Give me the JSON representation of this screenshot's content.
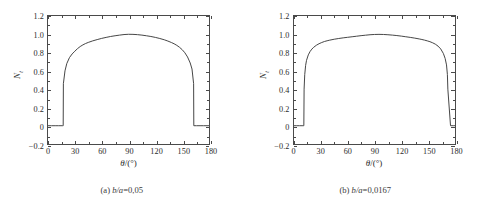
{
  "figure": {
    "panels": [
      {
        "id": "panel-a",
        "caption_prefix": "(a)",
        "caption_param": "b/a",
        "caption_value": "0,05",
        "caption_full": "(a) b/a=0,05"
      },
      {
        "id": "panel-b",
        "caption_prefix": "(b)",
        "caption_param": "b/a",
        "caption_value": "0,0167",
        "caption_full": "(b) b/a=0,0167"
      }
    ]
  },
  "chart_data": [
    {
      "type": "line",
      "title": "(a) b/a=0,05",
      "xlabel": "θ/(°)",
      "ylabel": "N_t",
      "xlim": [
        0,
        180
      ],
      "ylim": [
        -0.2,
        1.2
      ],
      "xticks": [
        0,
        30,
        60,
        90,
        120,
        150,
        180
      ],
      "yticks": [
        -0.2,
        0,
        0.2,
        0.4,
        0.6,
        0.8,
        1.0,
        1.2
      ],
      "xtick_labels": [
        "0",
        "30",
        "60",
        "90",
        "120",
        "150",
        "180"
      ],
      "ytick_labels": [
        "-0.2",
        "0",
        "0.2",
        "0.4",
        "0.6",
        "0.8",
        "1.0",
        "1.2"
      ],
      "grid": false,
      "legend": false,
      "line_color": "#3c3c3c",
      "series": [
        {
          "name": "N_t",
          "x": [
            0,
            4,
            8,
            12,
            16,
            17,
            17.2,
            19,
            21,
            24,
            27,
            30,
            33,
            36,
            39,
            42,
            45,
            50,
            55,
            60,
            65,
            70,
            75,
            80,
            85,
            90,
            95,
            100,
            105,
            110,
            115,
            120,
            125,
            130,
            134,
            138,
            141,
            144,
            147,
            150,
            153,
            156,
            159,
            161,
            162.8,
            163,
            166,
            170,
            174,
            180
          ],
          "y": [
            0,
            0,
            0,
            0,
            0,
            0,
            0.46,
            0.6,
            0.68,
            0.745,
            0.785,
            0.815,
            0.843,
            0.866,
            0.884,
            0.899,
            0.911,
            0.928,
            0.942,
            0.955,
            0.966,
            0.976,
            0.984,
            0.991,
            0.997,
            1.0,
            0.999,
            0.996,
            0.991,
            0.984,
            0.976,
            0.966,
            0.954,
            0.94,
            0.926,
            0.91,
            0.896,
            0.879,
            0.858,
            0.832,
            0.798,
            0.752,
            0.686,
            0.62,
            0.46,
            0,
            0,
            0,
            0,
            0
          ]
        }
      ],
      "annotations": {
        "rise_angle_deg": 17,
        "fall_angle_deg": 163,
        "peak_value": 1.0,
        "peak_angle_deg": 88
      }
    },
    {
      "type": "line",
      "title": "(b) b/a=0,0167",
      "xlabel": "θ/(°)",
      "ylabel": "N_t",
      "xlim": [
        0,
        180
      ],
      "ylim": [
        -0.2,
        1.2
      ],
      "xticks": [
        0,
        30,
        60,
        90,
        120,
        150,
        180
      ],
      "yticks": [
        -0.2,
        0,
        0.2,
        0.4,
        0.6,
        0.8,
        1.0,
        1.2
      ],
      "xtick_labels": [
        "0",
        "30",
        "60",
        "90",
        "120",
        "150",
        "180"
      ],
      "ytick_labels": [
        "-0.2",
        "0",
        "0.2",
        "0.4",
        "0.6",
        "0.8",
        "1.0",
        "1.2"
      ],
      "grid": false,
      "legend": false,
      "line_color": "#3c3c3c",
      "series": [
        {
          "name": "N_t",
          "x": [
            0,
            3,
            6,
            9,
            10.8,
            11,
            11.3,
            12,
            13,
            14,
            16,
            18,
            20,
            22,
            25,
            28,
            31,
            34,
            37,
            40,
            45,
            50,
            55,
            60,
            65,
            70,
            75,
            80,
            85,
            90,
            95,
            100,
            105,
            110,
            115,
            120,
            125,
            130,
            135,
            140,
            143,
            146,
            149,
            152,
            155,
            158,
            161,
            164,
            167,
            169,
            170.5,
            171.5,
            172,
            175,
            178,
            180
          ],
          "y": [
            0,
            0,
            0,
            0,
            0,
            0,
            0.4,
            0.56,
            0.66,
            0.715,
            0.775,
            0.812,
            0.838,
            0.858,
            0.88,
            0.897,
            0.91,
            0.921,
            0.929,
            0.936,
            0.946,
            0.954,
            0.961,
            0.967,
            0.973,
            0.979,
            0.985,
            0.99,
            0.995,
            0.998,
            0.999,
            0.998,
            0.995,
            0.991,
            0.986,
            0.98,
            0.973,
            0.966,
            0.958,
            0.949,
            0.943,
            0.936,
            0.928,
            0.919,
            0.907,
            0.892,
            0.871,
            0.84,
            0.79,
            0.735,
            0.665,
            0.56,
            0.4,
            0,
            0,
            0
          ]
        }
      ],
      "annotations": {
        "rise_angle_deg": 11,
        "fall_angle_deg": 172,
        "peak_value": 1.0,
        "peak_angle_deg": 93
      }
    }
  ]
}
